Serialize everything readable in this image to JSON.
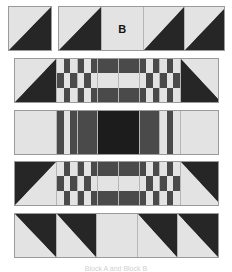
{
  "figure": {
    "caption": "Block A and Block B",
    "colors": {
      "light_fabric": "#e3e3e3",
      "medium_fabric": "#4a4a4a",
      "dark_fabric": "#262626",
      "darkest_fabric": "#1c1c1c",
      "seam_line": "#b6b6b6",
      "strip_border": "#9a9a9a",
      "background": "#ffffff"
    },
    "labels": {
      "block_b": "B"
    }
  },
  "rows": [
    {
      "name": "row-1-left",
      "description": "single half square triangle unit",
      "units": [
        {
          "type": "half-square-triangle",
          "orientation": "dark-bottom-right",
          "label": ""
        }
      ]
    },
    {
      "name": "row-1-right",
      "description": "four unit strip with labeled plain square",
      "units": [
        {
          "type": "half-square-triangle",
          "orientation": "dark-bottom-right",
          "label": ""
        },
        {
          "type": "plain-square",
          "orientation": "light",
          "label": "B"
        },
        {
          "type": "half-square-triangle",
          "orientation": "dark-bottom-right",
          "label": ""
        },
        {
          "type": "half-square-triangle",
          "orientation": "dark-bottom-right",
          "label": ""
        }
      ]
    },
    {
      "name": "row-2",
      "description": "pieced sashing strip, triangles point inward at top",
      "units": [
        {
          "type": "half-square-triangle",
          "orientation": "dark-bottom-right",
          "label": ""
        },
        {
          "type": "nine-patch",
          "pattern": [
            [
              "l",
              "d",
              "l"
            ],
            [
              "d",
              "l",
              "d"
            ],
            [
              "l",
              "d",
              "l"
            ]
          ],
          "label": ""
        },
        {
          "type": "nine-patch",
          "pattern": [
            [
              "d",
              "l",
              "d"
            ],
            [
              "l",
              "d",
              "l"
            ],
            [
              "d",
              "l",
              "d"
            ]
          ],
          "label": ""
        },
        {
          "type": "three-bar",
          "pattern": [
            "d",
            "l",
            "d"
          ],
          "label": ""
        },
        {
          "type": "three-bar",
          "pattern": [
            "d",
            "l",
            "d"
          ],
          "label": ""
        },
        {
          "type": "nine-patch",
          "pattern": [
            [
              "d",
              "l",
              "d"
            ],
            [
              "l",
              "d",
              "l"
            ],
            [
              "d",
              "l",
              "d"
            ]
          ],
          "label": ""
        },
        {
          "type": "nine-patch",
          "pattern": [
            [
              "l",
              "d",
              "l"
            ],
            [
              "d",
              "l",
              "d"
            ],
            [
              "l",
              "d",
              "l"
            ]
          ],
          "label": ""
        },
        {
          "type": "half-square-triangle",
          "orientation": "dark-bottom-left",
          "label": ""
        }
      ]
    },
    {
      "name": "row-3",
      "description": "vertical stripe strip with dark center square",
      "units": [
        {
          "type": "solid",
          "orientation": "light",
          "label": ""
        },
        {
          "type": "vertical-stripe",
          "pattern": [
            "d",
            "l",
            "d"
          ],
          "label": ""
        },
        {
          "type": "solid",
          "orientation": "medium",
          "label": ""
        },
        {
          "type": "solid",
          "orientation": "darkest",
          "label": ""
        },
        {
          "type": "solid",
          "orientation": "medium",
          "label": ""
        },
        {
          "type": "vertical-stripe",
          "pattern": [
            "l",
            "d",
            "l"
          ],
          "label": ""
        },
        {
          "type": "solid",
          "orientation": "light",
          "label": ""
        }
      ]
    },
    {
      "name": "row-4",
      "description": "pieced sashing strip, triangles point inward at bottom",
      "units": [
        {
          "type": "half-square-triangle",
          "orientation": "dark-top-left",
          "label": ""
        },
        {
          "type": "nine-patch",
          "pattern": [
            [
              "l",
              "d",
              "l"
            ],
            [
              "d",
              "l",
              "d"
            ],
            [
              "l",
              "d",
              "l"
            ]
          ],
          "label": ""
        },
        {
          "type": "nine-patch",
          "pattern": [
            [
              "d",
              "l",
              "d"
            ],
            [
              "l",
              "d",
              "l"
            ],
            [
              "d",
              "l",
              "d"
            ]
          ],
          "label": ""
        },
        {
          "type": "three-bar",
          "pattern": [
            "d",
            "l",
            "d"
          ],
          "label": ""
        },
        {
          "type": "three-bar",
          "pattern": [
            "d",
            "l",
            "d"
          ],
          "label": ""
        },
        {
          "type": "nine-patch",
          "pattern": [
            [
              "d",
              "l",
              "d"
            ],
            [
              "l",
              "d",
              "l"
            ],
            [
              "d",
              "l",
              "d"
            ]
          ],
          "label": ""
        },
        {
          "type": "nine-patch",
          "pattern": [
            [
              "l",
              "d",
              "l"
            ],
            [
              "d",
              "l",
              "d"
            ],
            [
              "l",
              "d",
              "l"
            ]
          ],
          "label": ""
        },
        {
          "type": "half-square-triangle",
          "orientation": "dark-top-right",
          "label": ""
        }
      ]
    },
    {
      "name": "row-5",
      "description": "five unit strip of triangles with a plain center square",
      "units": [
        {
          "type": "half-square-triangle",
          "orientation": "dark-top-right",
          "label": ""
        },
        {
          "type": "half-square-triangle",
          "orientation": "dark-top-right",
          "label": ""
        },
        {
          "type": "plain-square",
          "orientation": "light",
          "label": ""
        },
        {
          "type": "half-square-triangle",
          "orientation": "dark-top-right",
          "label": ""
        },
        {
          "type": "half-square-triangle",
          "orientation": "dark-top-right",
          "label": ""
        }
      ]
    }
  ]
}
